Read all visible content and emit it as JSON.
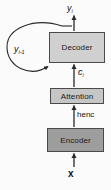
{
  "diagram": {
    "type": "block-flow-diagram",
    "background_color": "#fbfbfb",
    "nodes": [
      {
        "id": "encoder",
        "label": "Encoder",
        "fill_color": "#9d9d9d",
        "border_color": "#4a4a4a"
      },
      {
        "id": "attention",
        "label": "Attention",
        "fill_color": "#c6c6c6",
        "border_color": "#4a4a4a"
      },
      {
        "id": "decoder",
        "label": "Decoder",
        "fill_color": "#d0d0d0",
        "border_color": "#4a4a4a"
      }
    ],
    "edge_labels": {
      "input": "x",
      "encoder_output_base": "h",
      "encoder_output_sup": "enc",
      "encoder_output_full": "henc",
      "context_base": "c",
      "context_sub": "i",
      "context_full": "ci",
      "output_base": "y",
      "output_sub": "i",
      "output_full": "yi",
      "feedback_base": "y",
      "feedback_sub": "i-1",
      "feedback_full": "yi-1"
    },
    "edges": [
      {
        "from": "x",
        "to": "encoder",
        "label": "x"
      },
      {
        "from": "encoder",
        "to": "attention",
        "label": "henc"
      },
      {
        "from": "attention",
        "to": "decoder",
        "label": "ci"
      },
      {
        "from": "decoder",
        "to": "yi",
        "label": "yi"
      },
      {
        "from": "decoder",
        "to": "decoder",
        "label": "yi-1",
        "style": "recurrent-loop"
      }
    ],
    "line_color": "#2b2b2b"
  }
}
